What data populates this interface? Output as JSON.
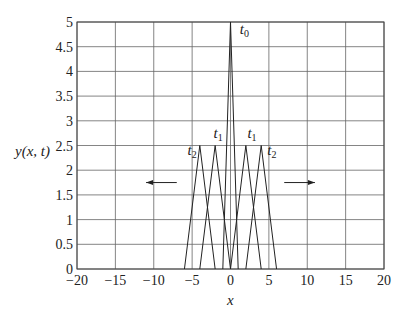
{
  "chart_data": {
    "type": "line",
    "title": "",
    "xlabel": "x",
    "ylabel": "y(x, t)",
    "xlim": [
      -20,
      20
    ],
    "ylim": [
      0,
      5
    ],
    "grid": true,
    "xticks": [
      "-20",
      "-15",
      "-10",
      "-5",
      "0",
      "5",
      "10",
      "15",
      "20"
    ],
    "yticks": [
      "0",
      "0.5",
      "1",
      "1.5",
      "2",
      "2.5",
      "3",
      "3.5",
      "4",
      "4.5",
      "5"
    ],
    "series": [
      {
        "name": "t0",
        "x": [
          -1,
          0,
          1
        ],
        "y": [
          0,
          5,
          0
        ]
      },
      {
        "name": "t1 (left)",
        "x": [
          -4,
          -2,
          0
        ],
        "y": [
          0,
          2.5,
          0
        ]
      },
      {
        "name": "t1 (right)",
        "x": [
          0,
          2,
          4
        ],
        "y": [
          0,
          2.5,
          0
        ]
      },
      {
        "name": "t2 (left)",
        "x": [
          -6,
          -4,
          -2
        ],
        "y": [
          0,
          2.5,
          0
        ]
      },
      {
        "name": "t2 (right)",
        "x": [
          2,
          4,
          6
        ],
        "y": [
          0,
          2.5,
          0
        ]
      }
    ],
    "annotations": [
      {
        "text": "t0",
        "x": 1.2,
        "y": 4.75
      },
      {
        "text": "t1",
        "x": -2.2,
        "y": 2.65
      },
      {
        "text": "t1",
        "x": 2.2,
        "y": 2.65
      },
      {
        "text": "t2",
        "x": -5.6,
        "y": 2.3
      },
      {
        "text": "t2",
        "x": 4.8,
        "y": 2.3
      },
      {
        "text": "arrow-left",
        "x1": -7,
        "x2": -11,
        "y": 1.75
      },
      {
        "text": "arrow-right",
        "x1": 7,
        "x2": 11,
        "y": 1.75
      }
    ]
  },
  "labels": {
    "xlabel": "x",
    "ylabel": "y(x, t)",
    "t0": "t",
    "t0_sub": "0",
    "t1": "t",
    "t1_sub": "1",
    "t2": "t",
    "t2_sub": "2"
  }
}
